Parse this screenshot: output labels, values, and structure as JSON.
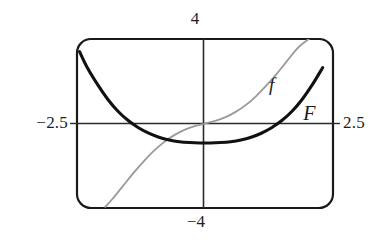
{
  "figure": {
    "kind": "graphing-calculator-viewing-window",
    "frame": {
      "stroke_color": "#1a1a1a",
      "corner_style": "rounded"
    },
    "axes": {
      "stroke_color": "#2b2b2b",
      "x_axis_visible": true,
      "y_axis_visible": true
    },
    "labels": {
      "y_max": "4",
      "y_min": "−4",
      "x_min": "−2.5",
      "x_max": "2.5"
    },
    "curves": {
      "f": {
        "label": "f",
        "color": "#9a9a9a",
        "width": 1.7,
        "style": "thin-gray"
      },
      "F": {
        "label": "F",
        "color": "#111111",
        "width": 3.0,
        "style": "thick-black"
      }
    }
  },
  "chart_data": {
    "type": "line",
    "title": "",
    "xlabel": "",
    "ylabel": "",
    "xlim": [
      -2.5,
      2.5
    ],
    "ylim": [
      -4,
      4
    ],
    "grid": false,
    "legend": "inline-curve-labels",
    "x_tick_labels": [
      "−2.5",
      "2.5"
    ],
    "y_tick_labels": [
      "−4",
      "4"
    ],
    "series": [
      {
        "name": "f",
        "color": "#9a9a9a",
        "annotation": "f",
        "annotation_x": 1.25,
        "annotation_y": 2.3,
        "x": [
          -1.95,
          -1.8,
          -1.6,
          -1.4,
          -1.2,
          -1.0,
          -0.8,
          -0.6,
          -0.4,
          -0.2,
          0.0,
          0.2,
          0.4,
          0.6,
          0.8,
          1.0,
          1.2,
          1.4,
          1.6,
          1.8,
          2.0,
          2.2
        ],
        "y": [
          -3.95,
          -3.55,
          -2.95,
          -2.35,
          -1.8,
          -1.3,
          -0.88,
          -0.55,
          -0.3,
          -0.12,
          0.0,
          0.12,
          0.3,
          0.55,
          0.88,
          1.3,
          1.8,
          2.35,
          2.95,
          3.55,
          3.95,
          4.3
        ]
      },
      {
        "name": "F",
        "color": "#111111",
        "annotation": "F",
        "annotation_x": 1.92,
        "annotation_y": 0.98,
        "x": [
          -2.45,
          -2.3,
          -2.1,
          -1.9,
          -1.7,
          -1.5,
          -1.3,
          -1.1,
          -0.9,
          -0.7,
          -0.5,
          -0.3,
          -0.1,
          0.1,
          0.3,
          0.5,
          0.7,
          0.9,
          1.1,
          1.3,
          1.5,
          1.7,
          1.9,
          2.1,
          2.3
        ],
        "y": [
          3.4,
          2.65,
          1.85,
          1.15,
          0.58,
          0.14,
          -0.2,
          -0.46,
          -0.65,
          -0.78,
          -0.86,
          -0.9,
          -0.92,
          -0.92,
          -0.9,
          -0.86,
          -0.78,
          -0.65,
          -0.46,
          -0.2,
          0.14,
          0.58,
          1.15,
          1.85,
          2.65
        ]
      }
    ]
  }
}
